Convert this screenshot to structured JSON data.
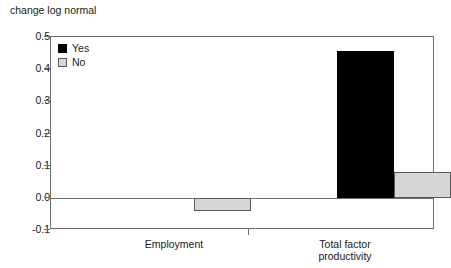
{
  "chart_data": {
    "type": "bar",
    "title": "change log normal",
    "xlabel": "",
    "ylabel": "",
    "ylim": [
      -0.1,
      0.5
    ],
    "ytick_labels": [
      "0.5",
      "0.4",
      "0.3",
      "0.2",
      "0.1",
      "0.0",
      "-0.1"
    ],
    "ytick_values": [
      0.5,
      0.4,
      0.3,
      0.2,
      0.1,
      0.0,
      -0.1
    ],
    "grid": false,
    "legend_position": "top-left",
    "categories": [
      "Employment",
      "Total factor productivity"
    ],
    "category_lines": [
      [
        "Employment"
      ],
      [
        "Total factor",
        "productivity"
      ]
    ],
    "series": [
      {
        "name": "Yes",
        "color": "#000000",
        "values": [
          0.0,
          0.455
        ]
      },
      {
        "name": "No",
        "color": "#d6d6d6",
        "values": [
          -0.042,
          0.08
        ]
      }
    ]
  },
  "legend": {
    "items": [
      {
        "label": "Yes",
        "swatch": "yes"
      },
      {
        "label": "No",
        "swatch": "no"
      }
    ]
  },
  "axis": {
    "y_labels": [
      "0.5",
      "0.4",
      "0.3",
      "0.2",
      "0.1",
      "0.0",
      "-0.1"
    ],
    "x_category_1_line_1": "Employment",
    "x_category_2_line_1": "Total factor",
    "x_category_2_line_2": "productivity"
  }
}
